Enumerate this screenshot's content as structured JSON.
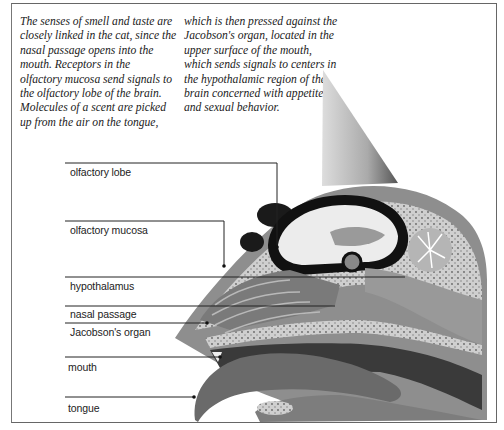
{
  "caption": {
    "column1": "The senses of smell and taste are\nclosely linked in the cat, since the\nnasal passage opens into the\nmouth. Receptors in the\nolfactory mucosa send signals to\nthe olfactory lobe of the brain.\nMolecules of a scent are picked\nup from the air on the tongue,",
    "column2": "which is then pressed against the\nJacobson's organ, located in the\nupper surface of the mouth,\nwhich sends signals to centers in\nthe hypothalamic region of the\nbrain concerned with appetite\nand sexual behavior."
  },
  "labels": [
    {
      "id": "olfactory-lobe",
      "text": "olfactory lobe"
    },
    {
      "id": "olfactory-mucosa",
      "text": "olfactory mucosa"
    },
    {
      "id": "hypothalamus",
      "text": "hypothalamus"
    },
    {
      "id": "nasal-passage",
      "text": "nasal passage"
    },
    {
      "id": "jacobsons-organ",
      "text": "Jacobson's organ"
    },
    {
      "id": "mouth",
      "text": "mouth"
    },
    {
      "id": "tongue",
      "text": "tongue"
    }
  ],
  "colors": {
    "bone": "#c9c9c9",
    "tissue": "#7a7a7a",
    "dark": "#1a1a1a",
    "brain": "#e8e8e8",
    "mouth_dark": "#3a3a3a"
  }
}
